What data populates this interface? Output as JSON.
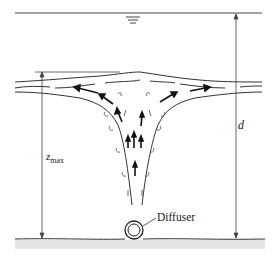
{
  "figure": {
    "labels": {
      "depth": "d",
      "zmax_main": "z",
      "zmax_sub": "max",
      "diffuser": "Diffuser"
    },
    "symbols": {
      "water_surface": "water-surface-triangle-mark"
    },
    "colors": {
      "line": "#333333",
      "background": "#ffffff",
      "sediment": "#888888"
    }
  }
}
